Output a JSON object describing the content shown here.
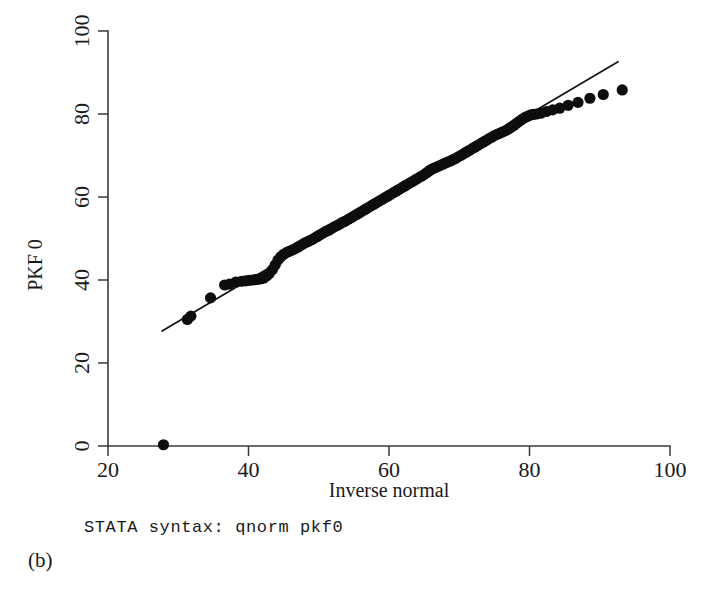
{
  "figure": {
    "subfigure_label": "(b)",
    "syntax_caption": "STATA syntax: qnorm pkf0"
  },
  "chart_data": {
    "type": "scatter",
    "title": "",
    "xlabel": "Inverse normal",
    "ylabel": "PKF 0",
    "xlim": [
      20,
      100
    ],
    "ylim": [
      0,
      100
    ],
    "xticks": [
      20,
      40,
      60,
      80,
      100
    ],
    "yticks": [
      0,
      20,
      40,
      60,
      80,
      100
    ],
    "xtick_labels": [
      "20",
      "40",
      "60",
      "80",
      "100"
    ],
    "ytick_labels": [
      "0",
      "20",
      "40",
      "60",
      "80",
      "100"
    ],
    "grid": false,
    "legend": "none",
    "marker": "filled-circle",
    "marker_color": "#0d0d0d",
    "marker_size": 7,
    "reference_line": {
      "label": "identity-line",
      "color": "#111111",
      "x": [
        27.7,
        92.6
      ],
      "y": [
        27.7,
        92.6
      ]
    },
    "series": [
      {
        "name": "pkf0 quantiles",
        "points": [
          [
            27.9,
            0.3
          ],
          [
            31.3,
            30.5
          ],
          [
            31.8,
            31.3
          ],
          [
            34.6,
            35.7
          ],
          [
            36.6,
            38.8
          ],
          [
            37.3,
            39.0
          ],
          [
            38.2,
            39.5
          ],
          [
            39.0,
            39.7
          ],
          [
            39.6,
            39.8
          ],
          [
            40.1,
            39.9
          ],
          [
            40.6,
            40.0
          ],
          [
            41.0,
            40.1
          ],
          [
            41.4,
            40.2
          ],
          [
            41.8,
            40.3
          ],
          [
            42.2,
            40.5
          ],
          [
            42.6,
            41.0
          ],
          [
            43.0,
            41.6
          ],
          [
            43.4,
            42.5
          ],
          [
            43.8,
            43.6
          ],
          [
            44.2,
            44.8
          ],
          [
            44.6,
            45.6
          ],
          [
            45.0,
            46.2
          ],
          [
            45.4,
            46.6
          ],
          [
            45.8,
            46.9
          ],
          [
            46.2,
            47.2
          ],
          [
            46.6,
            47.5
          ],
          [
            47.0,
            47.9
          ],
          [
            47.4,
            48.3
          ],
          [
            47.8,
            48.7
          ],
          [
            48.2,
            49.1
          ],
          [
            48.6,
            49.4
          ],
          [
            49.0,
            49.7
          ],
          [
            49.4,
            50.1
          ],
          [
            49.8,
            50.5
          ],
          [
            50.2,
            50.9
          ],
          [
            50.6,
            51.3
          ],
          [
            51.0,
            51.7
          ],
          [
            51.4,
            52.0
          ],
          [
            51.8,
            52.4
          ],
          [
            52.2,
            52.8
          ],
          [
            52.6,
            53.1
          ],
          [
            53.0,
            53.5
          ],
          [
            53.4,
            53.9
          ],
          [
            53.8,
            54.2
          ],
          [
            54.2,
            54.6
          ],
          [
            54.6,
            55.0
          ],
          [
            55.0,
            55.4
          ],
          [
            55.4,
            55.8
          ],
          [
            55.8,
            56.2
          ],
          [
            56.2,
            56.6
          ],
          [
            56.6,
            57.0
          ],
          [
            57.0,
            57.4
          ],
          [
            57.4,
            57.8
          ],
          [
            57.8,
            58.2
          ],
          [
            58.2,
            58.6
          ],
          [
            58.6,
            59.0
          ],
          [
            59.0,
            59.4
          ],
          [
            59.4,
            59.8
          ],
          [
            59.8,
            60.2
          ],
          [
            60.2,
            60.6
          ],
          [
            60.6,
            61.0
          ],
          [
            61.0,
            61.4
          ],
          [
            61.4,
            61.8
          ],
          [
            61.8,
            62.2
          ],
          [
            62.2,
            62.6
          ],
          [
            62.6,
            63.0
          ],
          [
            63.0,
            63.4
          ],
          [
            63.4,
            63.8
          ],
          [
            63.8,
            64.2
          ],
          [
            64.2,
            64.6
          ],
          [
            64.6,
            65.0
          ],
          [
            65.0,
            65.4
          ],
          [
            65.4,
            65.9
          ],
          [
            65.8,
            66.4
          ],
          [
            66.2,
            66.8
          ],
          [
            66.6,
            67.1
          ],
          [
            67.0,
            67.4
          ],
          [
            67.4,
            67.7
          ],
          [
            67.8,
            68.0
          ],
          [
            68.2,
            68.3
          ],
          [
            68.6,
            68.6
          ],
          [
            69.0,
            68.9
          ],
          [
            69.4,
            69.2
          ],
          [
            69.8,
            69.6
          ],
          [
            70.2,
            70.0
          ],
          [
            70.6,
            70.4
          ],
          [
            71.0,
            70.8
          ],
          [
            71.4,
            71.2
          ],
          [
            71.8,
            71.6
          ],
          [
            72.2,
            72.0
          ],
          [
            72.6,
            72.4
          ],
          [
            73.0,
            72.8
          ],
          [
            73.4,
            73.2
          ],
          [
            73.8,
            73.6
          ],
          [
            74.2,
            74.0
          ],
          [
            74.6,
            74.4
          ],
          [
            75.0,
            74.8
          ],
          [
            75.4,
            75.1
          ],
          [
            75.8,
            75.4
          ],
          [
            76.2,
            75.7
          ],
          [
            76.6,
            76.0
          ],
          [
            77.0,
            76.4
          ],
          [
            77.4,
            76.8
          ],
          [
            77.8,
            77.3
          ],
          [
            78.2,
            77.8
          ],
          [
            78.6,
            78.3
          ],
          [
            79.0,
            78.8
          ],
          [
            79.4,
            79.2
          ],
          [
            79.8,
            79.5
          ],
          [
            80.2,
            79.8
          ],
          [
            80.6,
            79.9
          ],
          [
            81.0,
            80.0
          ],
          [
            81.6,
            80.2
          ],
          [
            82.4,
            80.6
          ],
          [
            83.3,
            81.0
          ],
          [
            84.3,
            81.4
          ],
          [
            85.5,
            82.1
          ],
          [
            86.9,
            82.8
          ],
          [
            88.6,
            83.8
          ],
          [
            90.5,
            84.7
          ],
          [
            93.2,
            85.8
          ]
        ]
      }
    ]
  }
}
